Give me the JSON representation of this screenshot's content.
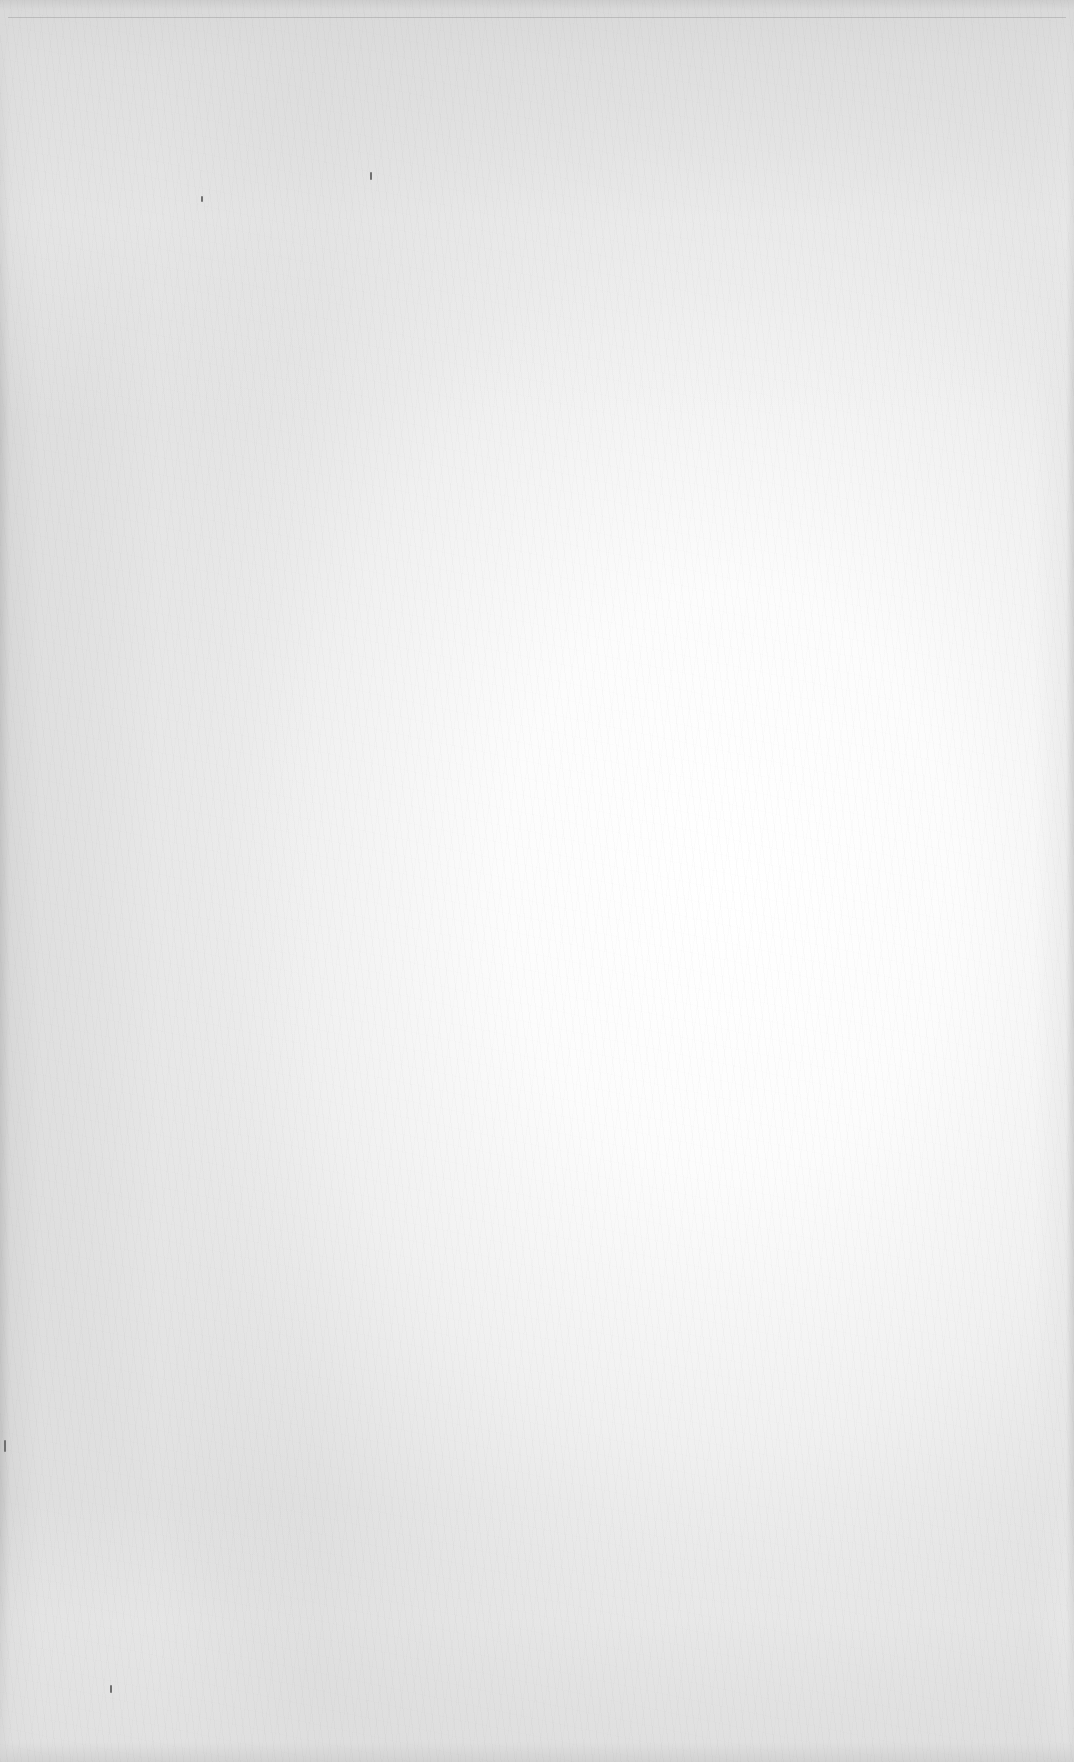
{
  "document": {
    "type": "blank scanned page",
    "text_content": [],
    "paper": {
      "center_color": "#ffffff",
      "edge_color": "#d6d6d6",
      "left_edge_color": "#c4c4c4",
      "rule_color": "#969696"
    },
    "specks": [
      {
        "x": 370,
        "y": 172,
        "h": 8
      },
      {
        "x": 201,
        "y": 196,
        "h": 6
      },
      {
        "x": 4,
        "y": 1440,
        "h": 12
      },
      {
        "x": 110,
        "y": 1685,
        "h": 8
      }
    ]
  }
}
